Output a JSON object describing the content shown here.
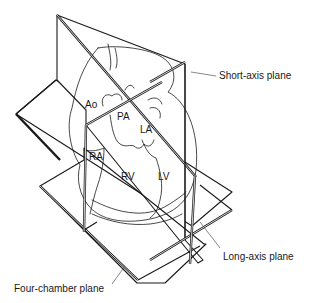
{
  "figure": {
    "planes": [
      {
        "id": "short-axis",
        "label": "Short-axis plane"
      },
      {
        "id": "long-axis",
        "label": "Long-axis plane"
      },
      {
        "id": "four-chamber",
        "label": "Four-chamber plane"
      }
    ],
    "chambers": [
      {
        "id": "ao",
        "label": "Ao"
      },
      {
        "id": "pa",
        "label": "PA"
      },
      {
        "id": "la",
        "label": "LA"
      },
      {
        "id": "ra",
        "label": "RA"
      },
      {
        "id": "rv",
        "label": "RV"
      },
      {
        "id": "lv",
        "label": "LV"
      }
    ],
    "colors": {
      "line": "#1a1a1a",
      "background": "#ffffff"
    }
  }
}
